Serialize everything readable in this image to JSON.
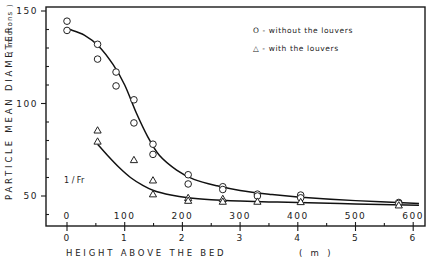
{
  "chart_data": {
    "type": "scatter",
    "title": "",
    "xlabel": "HEIGHT ABOVE THE BED",
    "xlabel_unit": "( m )",
    "ylabel": "PARTICLE MEAN DIAMETER",
    "ylabel_unit": "( microns )",
    "xlim": [
      -0.35,
      6.2
    ],
    "ylim": [
      34,
      150
    ],
    "x_ticks": [
      0,
      1,
      2,
      3,
      4,
      5,
      6
    ],
    "x_tick_labels": [
      "0",
      "1",
      "2",
      "3",
      "4",
      "5",
      "6"
    ],
    "secondary_x_label": "1 / Fr",
    "secondary_x_ticks": [
      0,
      100,
      200,
      300,
      400,
      500,
      600
    ],
    "secondary_x_tick_labels": [
      "0",
      "100",
      "200",
      "300",
      "400",
      "500",
      "600"
    ],
    "y_ticks": [
      50,
      100,
      150
    ],
    "y_tick_labels": [
      "50",
      "100",
      "150"
    ],
    "grid": false,
    "legend_position": "upper right",
    "series": [
      {
        "name": "without the louvers",
        "marker": "circle",
        "legend_label": "O - without the louvers",
        "points": [
          [
            0,
            144.5
          ],
          [
            0,
            139.5
          ],
          [
            0.53,
            132
          ],
          [
            0.53,
            124
          ],
          [
            0.85,
            117
          ],
          [
            0.85,
            109.5
          ],
          [
            1.16,
            102
          ],
          [
            1.16,
            89.5
          ],
          [
            1.49,
            78
          ],
          [
            1.49,
            72.5
          ],
          [
            2.1,
            61.5
          ],
          [
            2.1,
            56.5
          ],
          [
            2.7,
            55
          ],
          [
            2.7,
            53.5
          ],
          [
            3.3,
            51
          ],
          [
            3.3,
            50
          ],
          [
            4.05,
            50.5
          ],
          [
            4.05,
            49
          ],
          [
            5.75,
            46.5
          ],
          [
            5.75,
            46
          ]
        ],
        "fit_curve": [
          [
            0.05,
            140
          ],
          [
            0.3,
            137
          ],
          [
            0.55,
            131
          ],
          [
            0.8,
            121
          ],
          [
            1.0,
            110
          ],
          [
            1.2,
            95
          ],
          [
            1.4,
            82
          ],
          [
            1.6,
            72
          ],
          [
            1.9,
            64
          ],
          [
            2.2,
            59
          ],
          [
            2.6,
            55.5
          ],
          [
            3.0,
            53
          ],
          [
            3.5,
            51
          ],
          [
            4.0,
            49.5
          ],
          [
            5.0,
            47.5
          ],
          [
            6.1,
            46
          ]
        ]
      },
      {
        "name": "with the louvers",
        "marker": "triangle",
        "legend_label": "△ - with the louvers",
        "points": [
          [
            0.53,
            85.5
          ],
          [
            0.53,
            79.5
          ],
          [
            1.16,
            69.5
          ],
          [
            1.49,
            58.5
          ],
          [
            1.49,
            51
          ],
          [
            2.1,
            49
          ],
          [
            2.1,
            47.5
          ],
          [
            2.7,
            48.5
          ],
          [
            2.7,
            47
          ],
          [
            3.3,
            47
          ],
          [
            4.05,
            46.8
          ],
          [
            5.75,
            45
          ]
        ],
        "fit_curve": [
          [
            0.53,
            78
          ],
          [
            0.7,
            72
          ],
          [
            0.9,
            65.5
          ],
          [
            1.1,
            60
          ],
          [
            1.3,
            56
          ],
          [
            1.5,
            53
          ],
          [
            1.8,
            50.5
          ],
          [
            2.1,
            49
          ],
          [
            2.5,
            48
          ],
          [
            3.0,
            47.3
          ],
          [
            3.5,
            46.8
          ],
          [
            4.0,
            46.5
          ],
          [
            5.0,
            45.7
          ],
          [
            6.1,
            45
          ]
        ]
      }
    ],
    "annotations": [
      "1 / Fr"
    ]
  },
  "layout": {
    "plot_left_px": 46,
    "plot_top_px": 7,
    "plot_right_px": 425,
    "plot_bottom_px": 226,
    "x0_px": 67,
    "px_per_x": 57.7,
    "y150_px": 11,
    "px_per_y": 1.85
  },
  "colors": {
    "ink": "#1a1a1a",
    "background": "#ffffff"
  }
}
